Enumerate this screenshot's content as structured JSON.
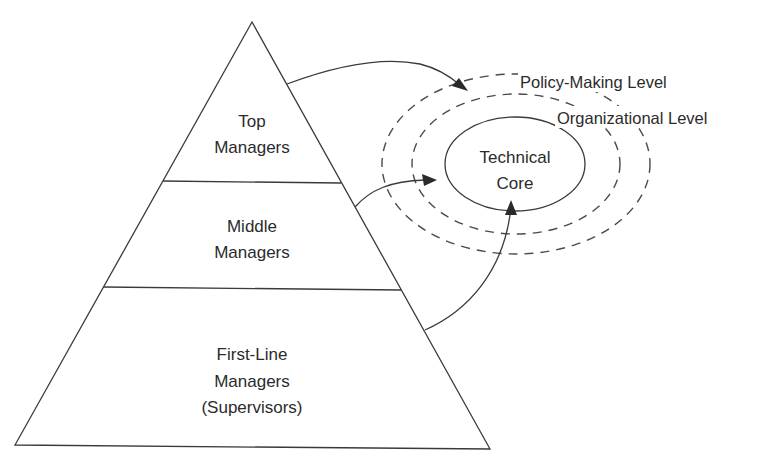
{
  "diagram": {
    "type": "pyramid-with-concentric-levels",
    "pyramid": {
      "tiers": [
        {
          "id": "top",
          "lines": [
            "Top",
            "Managers"
          ]
        },
        {
          "id": "middle",
          "lines": [
            "Middle",
            "Managers"
          ]
        },
        {
          "id": "first-line",
          "lines": [
            "First-Line",
            "Managers",
            "(Supervisors)"
          ]
        }
      ]
    },
    "levels": [
      {
        "id": "policy-making",
        "label": "Policy-Making Level",
        "style": "dashed"
      },
      {
        "id": "organizational",
        "label": "Organizational Level",
        "style": "dashed"
      },
      {
        "id": "technical-core",
        "lines": [
          "Technical",
          "Core"
        ],
        "style": "solid"
      }
    ],
    "connections": [
      {
        "from": "top",
        "to": "policy-making"
      },
      {
        "from": "middle",
        "to": "organizational"
      },
      {
        "from": "first-line",
        "to": "technical-core"
      }
    ],
    "colors": {
      "line": "#3a3a3a",
      "text": "#2b2b2b",
      "background": "#ffffff"
    }
  }
}
